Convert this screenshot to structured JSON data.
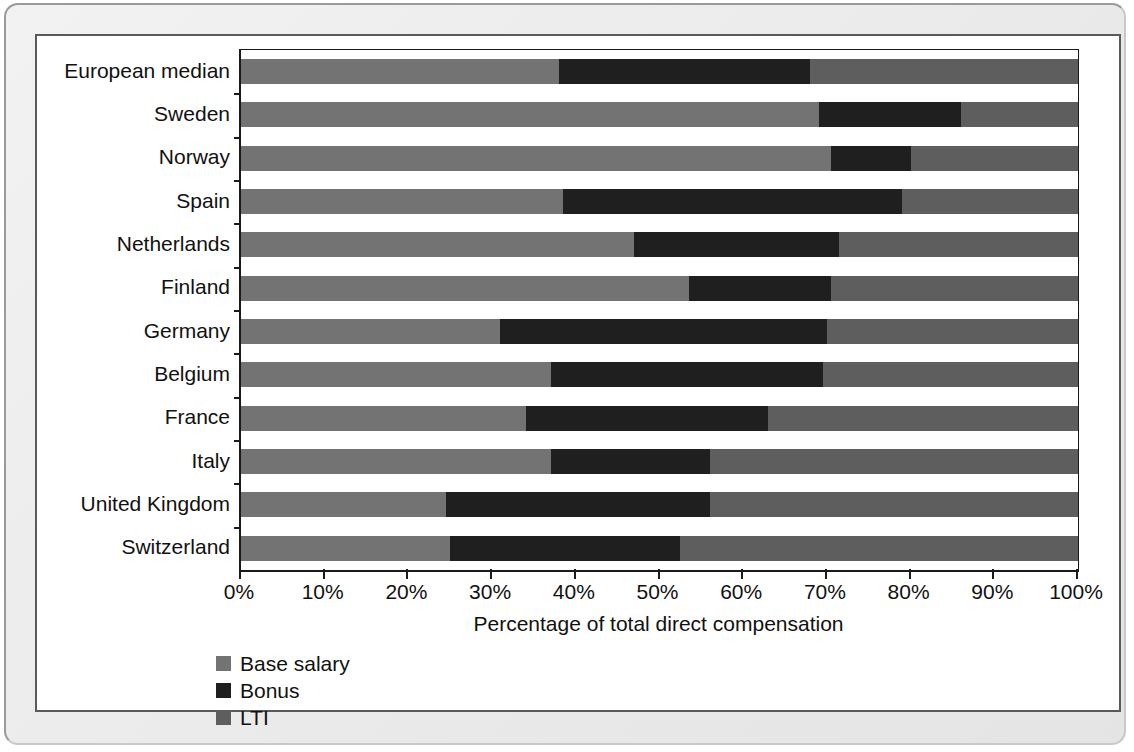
{
  "chart_data": {
    "type": "bar",
    "subtype": "stacked-horizontal-100",
    "title": "",
    "xlabel": "Percentage of total direct compensation",
    "ylabel": "",
    "xlim": [
      0,
      100
    ],
    "xticks": [
      "0%",
      "10%",
      "20%",
      "30%",
      "40%",
      "50%",
      "60%",
      "70%",
      "80%",
      "90%",
      "100%"
    ],
    "xtick_values": [
      0,
      10,
      20,
      30,
      40,
      50,
      60,
      70,
      80,
      90,
      100
    ],
    "grid": false,
    "legend_position": "bottom-left",
    "categories": [
      "European median",
      "Sweden",
      "Norway",
      "Spain",
      "Netherlands",
      "Finland",
      "Germany",
      "Belgium",
      "France",
      "Italy",
      "United Kingdom",
      "Switzerland"
    ],
    "series": [
      {
        "name": "Base salary",
        "color": "#737373",
        "values": [
          38,
          69,
          70.5,
          38.5,
          47,
          53.5,
          31,
          37,
          34,
          37,
          24.5,
          25
        ]
      },
      {
        "name": "Bonus",
        "color": "#1f1f1f",
        "values": [
          30,
          17,
          9.5,
          40.5,
          24.5,
          17,
          39,
          32.5,
          29,
          19,
          31.5,
          27.5
        ]
      },
      {
        "name": "LTI",
        "color": "#5e5e5e",
        "values": [
          32,
          14,
          20,
          21,
          28.5,
          29.5,
          30,
          30.5,
          37,
          44,
          44,
          47.5
        ]
      }
    ]
  },
  "legend": {
    "items": [
      {
        "label": "Base salary",
        "color": "#737373"
      },
      {
        "label": "Bonus",
        "color": "#1f1f1f"
      },
      {
        "label": "LTI",
        "color": "#5e5e5e"
      }
    ]
  },
  "colors": {
    "base_salary": "#737373",
    "bonus": "#1f1f1f",
    "lti": "#5e5e5e",
    "axis": "#1a1a1a",
    "panel_background": "#ffffff",
    "frame_background": "#ececec"
  }
}
